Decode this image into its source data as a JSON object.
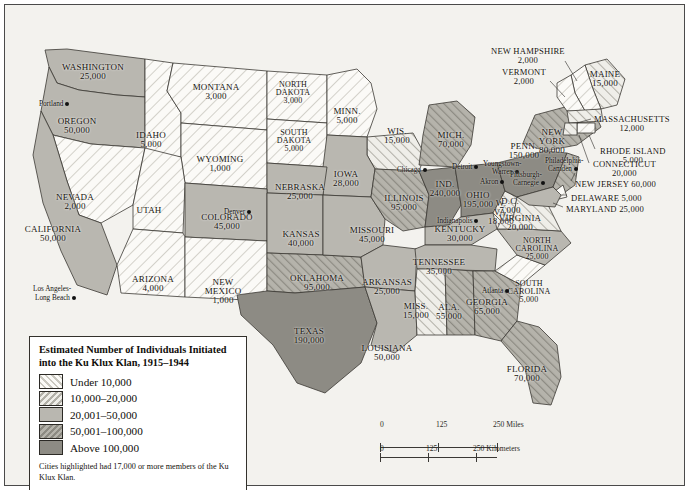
{
  "map": {
    "title": "Estimated Number of Individuals Initiated into the Ku Klux Klan, 1915-1944",
    "legend": {
      "title_line1": "Estimated Number of Individuals Initiated",
      "title_line2": "into the Ku Klux Klan, 1915–1944",
      "classes": [
        {
          "label": "Under 10,000",
          "pattern": "diagonal-forward-light",
          "color": "#f2f1ec"
        },
        {
          "label": "10,000–20,000",
          "pattern": "diagonal-back-light",
          "color": "#dcdad3"
        },
        {
          "label": "20,001–50,000",
          "pattern": "solid-mid",
          "color": "#b9b7b0"
        },
        {
          "label": "50,001–100,000",
          "pattern": "diagonal-back-dark",
          "color": "#a3a19a"
        },
        {
          "label": "Above 100,000",
          "pattern": "solid-dark",
          "color": "#8d8b84"
        }
      ],
      "note": "Cities highlighted had 17,000 or more members of the Ku Klux Klan."
    },
    "scale": {
      "miles": {
        "ticks": [
          "0",
          "125",
          "250"
        ],
        "unit": "Miles"
      },
      "kilometers": {
        "ticks": [
          "0",
          "125",
          "250"
        ],
        "unit": "Kilometers"
      }
    },
    "states": [
      {
        "name": "WASHINGTON",
        "value": "25,000",
        "class": 3,
        "x": 88,
        "y": 66
      },
      {
        "name": "OREGON",
        "value": "50,000",
        "class": 3,
        "x": 72,
        "y": 120
      },
      {
        "name": "IDAHO",
        "value": "5,000",
        "class": 1,
        "x": 146,
        "y": 134
      },
      {
        "name": "MONTANA",
        "value": "3,000",
        "class": 1,
        "x": 211,
        "y": 86
      },
      {
        "name": "WYOMING",
        "value": "1,000",
        "class": 1,
        "x": 215,
        "y": 158
      },
      {
        "name": "NORTH DAKOTA",
        "value": "3,000",
        "class": 1,
        "x": 288,
        "y": 84
      },
      {
        "name": "SOUTH DAKOTA",
        "value": "5,000",
        "class": 1,
        "x": 289,
        "y": 132
      },
      {
        "name": "MINN.",
        "value": "5,000",
        "class": 1,
        "x": 342,
        "y": 110
      },
      {
        "name": "WIS.",
        "value": "15,000",
        "class": 2,
        "x": 392,
        "y": 130
      },
      {
        "name": "IOWA",
        "value": "28,000",
        "class": 3,
        "x": 341,
        "y": 173
      },
      {
        "name": "NEBRASKA",
        "value": "25,000",
        "class": 3,
        "x": 295,
        "y": 186
      },
      {
        "name": "NEVADA",
        "value": "2,000",
        "class": 1,
        "x": 70,
        "y": 196
      },
      {
        "name": "UTAH",
        "value": "",
        "class": 1,
        "x": 144,
        "y": 209
      },
      {
        "name": "CALIFORNIA",
        "value": "50,000",
        "class": 3,
        "x": 48,
        "y": 228
      },
      {
        "name": "COLORADO",
        "value": "45,000",
        "class": 3,
        "x": 222,
        "y": 216
      },
      {
        "name": "ARIZONA",
        "value": "4,000",
        "class": 1,
        "x": 148,
        "y": 278
      },
      {
        "name": "NEW MEXICO",
        "value": "1,000",
        "class": 1,
        "x": 218,
        "y": 281
      },
      {
        "name": "KANSAS",
        "value": "40,000",
        "class": 3,
        "x": 296,
        "y": 233
      },
      {
        "name": "OKLAHOMA",
        "value": "95,000",
        "class": 4,
        "x": 312,
        "y": 277
      },
      {
        "name": "TEXAS",
        "value": "190,000",
        "class": 5,
        "x": 304,
        "y": 330
      },
      {
        "name": "MISSOURI",
        "value": "45,000",
        "class": 3,
        "x": 367,
        "y": 229
      },
      {
        "name": "ARKANSAS",
        "value": "25,000",
        "class": 3,
        "x": 382,
        "y": 281
      },
      {
        "name": "LOUISIANA",
        "value": "50,000",
        "class": 3,
        "x": 382,
        "y": 347
      },
      {
        "name": "ILLINOIS",
        "value": "95,000",
        "class": 4,
        "x": 399,
        "y": 197
      },
      {
        "name": "IND.",
        "value": "240,000",
        "class": 5,
        "x": 440,
        "y": 183
      },
      {
        "name": "MICH.",
        "value": "70,000",
        "class": 4,
        "x": 446,
        "y": 134
      },
      {
        "name": "OHIO",
        "value": "195,000",
        "class": 5,
        "x": 473,
        "y": 194
      },
      {
        "name": "KENTUCKY",
        "value": "30,000",
        "class": 3,
        "x": 455,
        "y": 228
      },
      {
        "name": "TENNESSEE",
        "value": "35,000",
        "class": 3,
        "x": 434,
        "y": 261
      },
      {
        "name": "MISS.",
        "value": "15,000",
        "class": 2,
        "x": 411,
        "y": 305
      },
      {
        "name": "ALA.",
        "value": "55,000",
        "class": 4,
        "x": 444,
        "y": 306
      },
      {
        "name": "GEORGIA",
        "value": "65,000",
        "class": 4,
        "x": 482,
        "y": 301
      },
      {
        "name": "FLORIDA",
        "value": "70,000",
        "class": 4,
        "x": 522,
        "y": 368
      },
      {
        "name": "SOUTH CAROLINA",
        "value": "5,000",
        "class": 1,
        "x": 524,
        "y": 283
      },
      {
        "name": "NORTH CAROLINA",
        "value": "25,000",
        "class": 3,
        "x": 532,
        "y": 240
      },
      {
        "name": "W. VA.",
        "value": "18,000",
        "class": 2,
        "x": 496,
        "y": 202
      },
      {
        "name": "VIRGINIA",
        "value": "20,000",
        "class": 2,
        "x": 515,
        "y": 217
      },
      {
        "name": "PENN.",
        "value": "150,000",
        "class": 5,
        "x": 519,
        "y": 145
      },
      {
        "name": "NEW YORK",
        "value": "80,000",
        "class": 4,
        "x": 547,
        "y": 131
      },
      {
        "name": "MAINE",
        "value": "15,000",
        "class": 2,
        "x": 600,
        "y": 73
      },
      {
        "name": "D.C.",
        "value": "7,000",
        "class": 1,
        "x": 505,
        "y": 200
      }
    ],
    "callout_states": [
      {
        "name": "NEW HAMPSHIRE",
        "value": "2,000",
        "x": 486,
        "y": 42,
        "align": "left"
      },
      {
        "name": "VERMONT",
        "value": "2,000",
        "x": 497,
        "y": 63,
        "align": "left"
      },
      {
        "name": "MASSACHUSETTS",
        "value": "12,000",
        "x": 589,
        "y": 110,
        "align": "left"
      },
      {
        "name": "RHODE ISLAND",
        "value": "5,000",
        "x": 595,
        "y": 142,
        "align": "left"
      },
      {
        "name": "CONNECTICUT",
        "value": "20,000",
        "x": 588,
        "y": 155,
        "align": "left"
      },
      {
        "name": "NEW JERSEY 60,000",
        "value": "",
        "x": 570,
        "y": 175,
        "align": "left"
      },
      {
        "name": "DELAWARE 5,000",
        "value": "",
        "x": 566,
        "y": 189,
        "align": "left"
      },
      {
        "name": "MARYLAND 25,000",
        "value": "",
        "x": 561,
        "y": 200,
        "align": "left"
      }
    ],
    "cities": [
      {
        "name": "Portland",
        "x": 34,
        "y": 95,
        "side": "left"
      },
      {
        "name": "Los Angeles-",
        "x": 28,
        "y": 280,
        "side": "left"
      },
      {
        "name": "Long Beach",
        "x": 30,
        "y": 289,
        "side": "left"
      },
      {
        "name": "Denver",
        "x": 219,
        "y": 203,
        "side": "left"
      },
      {
        "name": "Chicago",
        "x": 392,
        "y": 161,
        "side": "left"
      },
      {
        "name": "Detroit",
        "x": 447,
        "y": 158,
        "side": "left"
      },
      {
        "name": "Youngstown-",
        "x": 478,
        "y": 155,
        "side": "left"
      },
      {
        "name": "Warren",
        "x": 487,
        "y": 163,
        "side": "left"
      },
      {
        "name": "Akron",
        "x": 475,
        "y": 173,
        "side": "left"
      },
      {
        "name": "Pittsburgh-",
        "x": 505,
        "y": 166,
        "side": "left"
      },
      {
        "name": "Carnegie",
        "x": 508,
        "y": 174,
        "side": "left"
      },
      {
        "name": "Indianapolis",
        "x": 432,
        "y": 212,
        "side": "left"
      },
      {
        "name": "Philadelphia-",
        "x": 540,
        "y": 152,
        "side": "left"
      },
      {
        "name": "Camden",
        "x": 543,
        "y": 160,
        "side": "left"
      },
      {
        "name": "Atlanta",
        "x": 477,
        "y": 282,
        "side": "left"
      }
    ]
  }
}
